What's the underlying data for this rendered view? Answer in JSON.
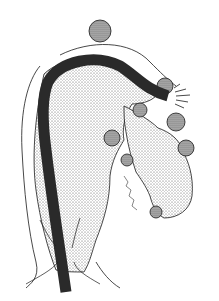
{
  "illustration": {
    "subject": "endoscope inserted through colon with diverticula",
    "style": "black and white stippled medical line drawing",
    "colors": {
      "background": "#ffffff",
      "ink": "#1a1a1a",
      "stipple_light": "#d8d8d8",
      "stipple_mid": "#b8b8b8",
      "stipple_dark": "#555555",
      "scope": "#2a2a2a"
    },
    "elements": [
      "outer-colon-outline",
      "colon-lumen-stippled",
      "endoscope-tube",
      "endoscope-tip-spray",
      "diverticula-pouches",
      "rectum-anal-canal",
      "artist-signature"
    ]
  }
}
